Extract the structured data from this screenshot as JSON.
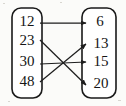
{
  "diagram": {
    "type": "mapping-diagram",
    "title": "",
    "style": {
      "background": "#fbfbf9",
      "box_fill": "#ffffff",
      "stroke": "#1a1a1a",
      "text_color": "#151515"
    },
    "domain_box": {
      "name": "domain",
      "x": 12,
      "y": 8,
      "width": 30,
      "height": 90,
      "rx": 9,
      "items": [
        {
          "label": "12",
          "cx": 27,
          "cy": 23
        },
        {
          "label": "23",
          "cx": 27,
          "cy": 42
        },
        {
          "label": "30",
          "cx": 27,
          "cy": 63
        },
        {
          "label": "48",
          "cx": 27,
          "cy": 83
        }
      ]
    },
    "range_box": {
      "name": "range",
      "x": 82,
      "y": 8,
      "width": 34,
      "height": 90,
      "rx": 9,
      "items": [
        {
          "label": "6",
          "cx": 100,
          "cy": 23
        },
        {
          "label": "13",
          "cx": 101,
          "cy": 45
        },
        {
          "label": "15",
          "cx": 101,
          "cy": 63
        },
        {
          "label": "20",
          "cx": 101,
          "cy": 85
        }
      ]
    },
    "arrows": [
      {
        "name": "arrow-12-to-6",
        "from": "12",
        "to": "6",
        "x1": 40,
        "y1": 23,
        "x2": 86,
        "y2": 23
      },
      {
        "name": "arrow-23-to-20",
        "from": "23",
        "to": "20",
        "x1": 40,
        "y1": 40,
        "x2": 86,
        "y2": 85
      },
      {
        "name": "arrow-30-to-15",
        "from": "30",
        "to": "15",
        "x1": 40,
        "y1": 64,
        "x2": 86,
        "y2": 62
      },
      {
        "name": "arrow-48-to-13",
        "from": "48",
        "to": "13",
        "x1": 40,
        "y1": 82,
        "x2": 86,
        "y2": 44
      }
    ],
    "pairs": [
      {
        "input": "12",
        "output": "6"
      },
      {
        "input": "23",
        "output": "20"
      },
      {
        "input": "30",
        "output": "15"
      },
      {
        "input": "48",
        "output": "13"
      }
    ]
  }
}
